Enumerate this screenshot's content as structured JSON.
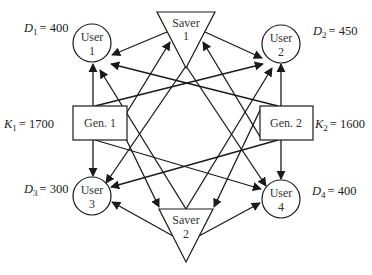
{
  "diagram": {
    "title": "",
    "users": [
      {
        "id": "user1",
        "line1": "User",
        "line2": "1",
        "demand_label": "D",
        "demand_sub": "1",
        "demand_value": "= 400"
      },
      {
        "id": "user2",
        "line1": "User",
        "line2": "2",
        "demand_label": "D",
        "demand_sub": "2",
        "demand_value": "= 450"
      },
      {
        "id": "user3",
        "line1": "User",
        "line2": "3",
        "demand_label": "D",
        "demand_sub": "3",
        "demand_value": "= 300"
      },
      {
        "id": "user4",
        "line1": "User",
        "line2": "4",
        "demand_label": "D",
        "demand_sub": "4",
        "demand_value": "= 400"
      }
    ],
    "generators": [
      {
        "id": "gen1",
        "label": "Gen. 1",
        "capacity_label": "K",
        "capacity_sub": "1",
        "capacity_value": "= 1700"
      },
      {
        "id": "gen2",
        "label": "Gen. 2",
        "capacity_label": "K",
        "capacity_sub": "2",
        "capacity_value": "= 1600"
      }
    ],
    "savers": [
      {
        "id": "saver1",
        "line1": "Saver",
        "line2": "1"
      },
      {
        "id": "saver2",
        "line1": "Saver",
        "line2": "2"
      }
    ],
    "edges": [
      {
        "from": "saver1",
        "to": "user1"
      },
      {
        "from": "saver1",
        "to": "user2"
      },
      {
        "from": "saver1",
        "to": "user3"
      },
      {
        "from": "saver1",
        "to": "user4"
      },
      {
        "from": "saver2",
        "to": "user1"
      },
      {
        "from": "saver2",
        "to": "user2"
      },
      {
        "from": "saver2",
        "to": "user3"
      },
      {
        "from": "saver2",
        "to": "user4"
      },
      {
        "from": "gen1",
        "to": "user1"
      },
      {
        "from": "gen1",
        "to": "user2"
      },
      {
        "from": "gen1",
        "to": "user3"
      },
      {
        "from": "gen1",
        "to": "user4"
      },
      {
        "from": "gen1",
        "to": "saver1"
      },
      {
        "from": "gen1",
        "to": "saver2"
      },
      {
        "from": "gen2",
        "to": "user1"
      },
      {
        "from": "gen2",
        "to": "user2"
      },
      {
        "from": "gen2",
        "to": "user3"
      },
      {
        "from": "gen2",
        "to": "user4"
      },
      {
        "from": "gen2",
        "to": "saver1"
      },
      {
        "from": "gen2",
        "to": "saver2"
      }
    ],
    "colors": {
      "stroke": "#1a1a1a",
      "text": "#333333",
      "background": "#ffffff"
    }
  }
}
